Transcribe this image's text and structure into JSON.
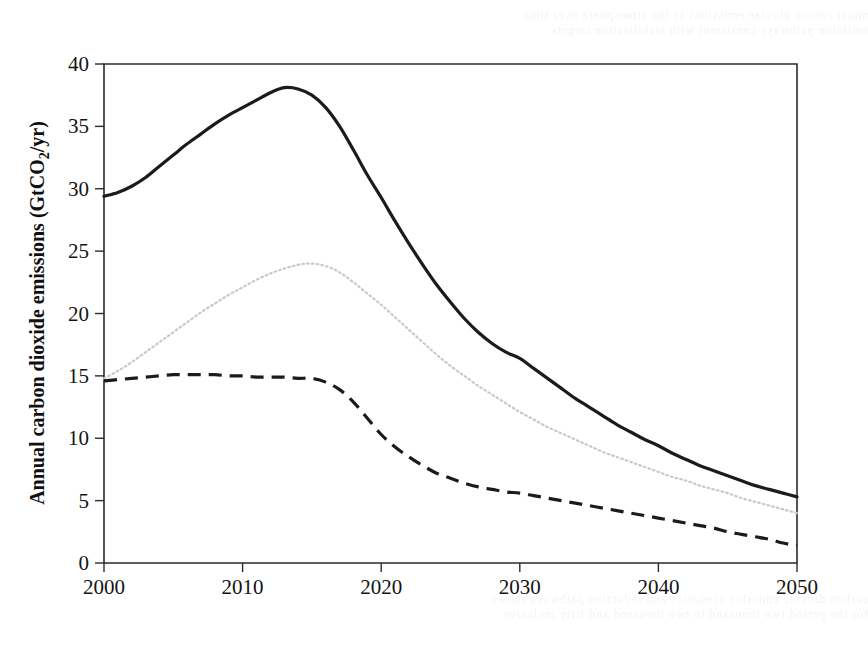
{
  "figure": {
    "background_color": "#ffffff",
    "frame_color": "#2b2b2b"
  },
  "bleed_through": {
    "top_line_1": "nnuai caroon aioxiae emissions in tne atmospnere over time",
    "top_line_2": "emission pathways consistent with stabilisation targets",
    "bottom_line_1": "carbon dioxide emission scenarios and reduction pathways shown",
    "bottom_line_2": "for the period two thousand to two thousand and fifty inclusive"
  },
  "chart_data": {
    "type": "line",
    "title": "",
    "subtitle": "",
    "xlabel": "",
    "ylabel": "Annual carbon dioxide emissions (GtCO₂/yr)",
    "ylabel_parts": {
      "prefix": "Annual carbon dioxide emissions (GtCO",
      "subscript": "2",
      "suffix": "/yr)"
    },
    "xlim": [
      2000,
      2050
    ],
    "ylim": [
      0,
      40
    ],
    "xticks": [
      2000,
      2010,
      2020,
      2030,
      2040,
      2050
    ],
    "xtick_labels": [
      "2000",
      "2010",
      "2020",
      "2030",
      "2040",
      "2050"
    ],
    "yticks": [
      0,
      5,
      10,
      15,
      20,
      25,
      30,
      35,
      40
    ],
    "ytick_labels": [
      "0",
      "5",
      "10",
      "15",
      "20",
      "25",
      "30",
      "35",
      "40"
    ],
    "grid": false,
    "legend": false,
    "legend_position": "none",
    "x": [
      2000,
      2001,
      2002,
      2003,
      2004,
      2005,
      2006,
      2007,
      2008,
      2009,
      2010,
      2011,
      2012,
      2013,
      2014,
      2015,
      2016,
      2017,
      2018,
      2019,
      2020,
      2021,
      2022,
      2023,
      2024,
      2025,
      2026,
      2027,
      2028,
      2029,
      2030,
      2031,
      2032,
      2033,
      2034,
      2035,
      2036,
      2037,
      2038,
      2039,
      2040,
      2041,
      2042,
      2043,
      2044,
      2045,
      2046,
      2047,
      2048,
      2049,
      2050
    ],
    "series": [
      {
        "name": "upper-pathway",
        "style": "solid",
        "color": "#1b1b1b",
        "values": [
          29.4,
          29.7,
          30.2,
          30.9,
          31.8,
          32.7,
          33.6,
          34.4,
          35.2,
          35.9,
          36.5,
          37.1,
          37.7,
          38.1,
          38.0,
          37.5,
          36.5,
          35.0,
          33.1,
          31.1,
          29.3,
          27.4,
          25.6,
          23.9,
          22.3,
          20.9,
          19.6,
          18.5,
          17.6,
          16.9,
          16.4,
          15.6,
          14.8,
          14.0,
          13.2,
          12.5,
          11.8,
          11.1,
          10.5,
          9.9,
          9.4,
          8.8,
          8.3,
          7.8,
          7.4,
          7.0,
          6.6,
          6.2,
          5.9,
          5.6,
          5.3
        ]
      },
      {
        "name": "middle-pathway",
        "style": "dotted",
        "color": "#c9c9c9",
        "values": [
          14.8,
          15.4,
          16.1,
          16.9,
          17.7,
          18.5,
          19.3,
          20.1,
          20.8,
          21.5,
          22.1,
          22.7,
          23.2,
          23.6,
          23.9,
          24.0,
          23.8,
          23.3,
          22.5,
          21.6,
          20.7,
          19.7,
          18.7,
          17.7,
          16.7,
          15.8,
          15.0,
          14.2,
          13.5,
          12.8,
          12.1,
          11.5,
          10.9,
          10.4,
          9.9,
          9.4,
          8.9,
          8.5,
          8.1,
          7.7,
          7.3,
          6.9,
          6.6,
          6.2,
          5.9,
          5.6,
          5.2,
          4.9,
          4.6,
          4.3,
          4.0
        ]
      },
      {
        "name": "lower-pathway",
        "style": "dashed",
        "color": "#1b1b1b",
        "values": [
          14.6,
          14.7,
          14.8,
          14.9,
          15.0,
          15.1,
          15.1,
          15.1,
          15.1,
          15.0,
          15.0,
          14.9,
          14.9,
          14.9,
          14.8,
          14.8,
          14.5,
          13.9,
          12.9,
          11.6,
          10.3,
          9.3,
          8.5,
          7.8,
          7.2,
          6.8,
          6.4,
          6.1,
          5.9,
          5.7,
          5.6,
          5.4,
          5.2,
          5.0,
          4.8,
          4.6,
          4.4,
          4.2,
          4.0,
          3.8,
          3.6,
          3.4,
          3.2,
          3.0,
          2.8,
          2.5,
          2.3,
          2.1,
          1.9,
          1.6,
          1.4
        ]
      }
    ],
    "annotations": []
  },
  "geometry": {
    "plot_left": 104,
    "plot_right": 797,
    "plot_top": 64,
    "plot_bottom": 563
  }
}
